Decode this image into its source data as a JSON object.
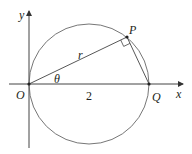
{
  "diagram": {
    "title": "",
    "labels": {
      "y_axis": "y",
      "x_axis": "x",
      "origin": "O",
      "point_p": "P",
      "point_q": "Q",
      "radius": "r",
      "angle": "θ",
      "diameter_length": "2"
    },
    "colors": {
      "stroke": "#555555",
      "text": "#231f20",
      "background": "#ffffff"
    }
  }
}
